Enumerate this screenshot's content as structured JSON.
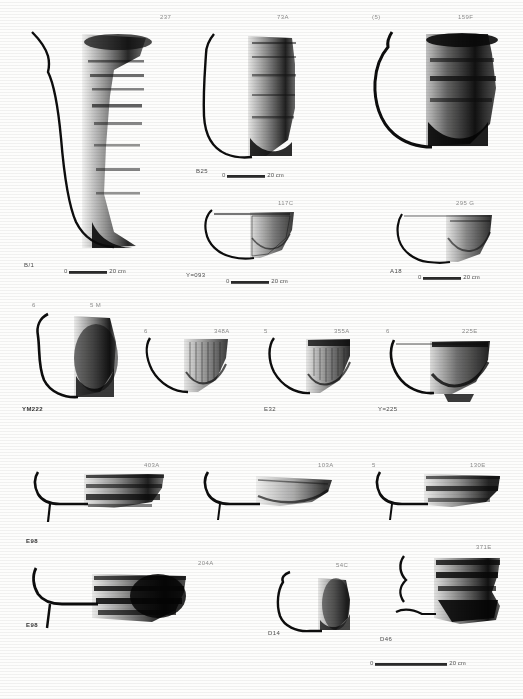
{
  "plate": {
    "kind": "archaeological-pottery-plate",
    "background_color": "#fdfdfc",
    "ink_color": "#111111",
    "scale_unit": "20 cm",
    "scale_zero": "0"
  },
  "rows": [
    {
      "id": "row-1",
      "vessels": [
        {
          "name": "vessel-237",
          "catalog": "237",
          "context": "B/1",
          "form": "tall-jar-flaring-rim",
          "scale": {
            "zero": "0",
            "unit": "20 cm"
          }
        },
        {
          "name": "vessel-73A",
          "catalog": "73A",
          "context": "B25",
          "form": "ovoid-jar",
          "scale": {
            "zero": "0",
            "unit": "20 cm"
          }
        },
        {
          "name": "vessel-159F",
          "catalog": "159F",
          "context": "(5)",
          "form": "wide-mouth-storage-jar",
          "scale": null
        }
      ]
    },
    {
      "id": "row-2",
      "vessels": [
        {
          "name": "vessel-117C",
          "catalog": "117C",
          "context": "Y=093",
          "form": "shallow-bowl",
          "scale": {
            "zero": "0",
            "unit": "20 cm"
          }
        },
        {
          "name": "vessel-295G",
          "catalog": "295 G",
          "context": "A18",
          "form": "carinated-bowl",
          "scale": {
            "zero": "0",
            "unit": "20 cm"
          }
        }
      ]
    },
    {
      "id": "row-3",
      "vessels": [
        {
          "name": "vessel-5M",
          "catalog": "5 M",
          "figure_no": "6",
          "context": "YM222",
          "form": "deep-rounded-jar"
        },
        {
          "name": "vessel-348A",
          "catalog": "348A",
          "figure_no": "6",
          "context": "",
          "form": "flared-bowl"
        },
        {
          "name": "vessel-355A",
          "catalog": "355A",
          "figure_no": "5",
          "context": "E32",
          "form": "flared-bowl"
        },
        {
          "name": "vessel-225E",
          "catalog": "225E",
          "figure_no": "6",
          "context": "Y=225",
          "form": "footed-bowl"
        }
      ]
    },
    {
      "id": "row-4",
      "vessels": [
        {
          "name": "vessel-403A",
          "catalog": "403A",
          "context": "E98",
          "form": "wide-open-bowl"
        },
        {
          "name": "vessel-103A",
          "catalog": "103A",
          "context": "",
          "form": "shallow-open-bowl"
        },
        {
          "name": "vessel-130E",
          "catalog": "130E",
          "figure_no": "5",
          "context": "",
          "form": "shallow-open-bowl"
        }
      ]
    },
    {
      "id": "row-5",
      "vessels": [
        {
          "name": "vessel-204A",
          "catalog": "204A",
          "context": "E98",
          "form": "ring-based-bowl"
        },
        {
          "name": "vessel-54C",
          "catalog": "54C",
          "context": "D14",
          "form": "small-ovoid-jar"
        },
        {
          "name": "vessel-371E",
          "catalog": "371E",
          "context": "D46",
          "form": "carinated-jar"
        }
      ]
    }
  ],
  "bottom_scale": {
    "zero": "0",
    "unit": "20 cm"
  }
}
